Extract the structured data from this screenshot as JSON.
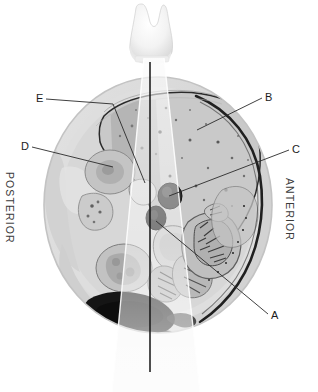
{
  "figure": {
    "kind": "anatomical-cross-section-with-ultrasound-beam",
    "modality_overlay": "ultrasound sector beam",
    "background_color": "#ffffff",
    "ink_color": "#1b1b1b",
    "section_plane": "transverse abdominal section",
    "probe": {
      "name": "transducer",
      "position": "top midline",
      "beam_apex_x": 143,
      "beam_center_line_bottom_y": 372
    }
  },
  "orientation_labels": [
    {
      "text": "POSTERIOR",
      "side": "left",
      "rotation_deg": 90
    },
    {
      "text": "ANTERIOR",
      "side": "right",
      "rotation_deg": 90
    }
  ],
  "leader_labels": [
    {
      "letter": "A",
      "label_x": 272,
      "label_y": 318,
      "target_x": 157,
      "target_y": 221,
      "target_structure": "inferior vena cava",
      "text_side": "right"
    },
    {
      "letter": "B",
      "label_x": 266,
      "label_y": 94,
      "target_x": 197,
      "target_y": 129,
      "target_structure": "liver parenchyma",
      "text_side": "right"
    },
    {
      "letter": "C",
      "label_x": 293,
      "label_y": 146,
      "target_x": 169,
      "target_y": 195,
      "target_structure": "abdominal aorta",
      "text_side": "right"
    },
    {
      "letter": "D",
      "label_x": 22,
      "label_y": 143,
      "target_x": 113,
      "target_y": 166,
      "target_structure": "right kidney",
      "text_side": "left"
    },
    {
      "letter": "E",
      "label_x": 38,
      "label_y": 95,
      "elbow_x": 113,
      "elbow_y": 104,
      "target_x": 144,
      "target_y": 182,
      "target_structure": "diaphragm / liver border",
      "text_side": "left"
    }
  ],
  "anatomy_regions": [
    {
      "name": "body-wall-outline",
      "tone": "#d9d9d9"
    },
    {
      "name": "subcutaneous-fat",
      "tone": "#e6e6e6"
    },
    {
      "name": "liver",
      "tone": "#c6c6c6"
    },
    {
      "name": "liver-beam-shadow",
      "tone": "#a9a9a9"
    },
    {
      "name": "right-kidney",
      "tone": "#c0c0c0"
    },
    {
      "name": "vertebral-body",
      "tone": "#cfcfcf"
    },
    {
      "name": "aorta",
      "tone": "#2e2e2e"
    },
    {
      "name": "inferior-vena-cava",
      "tone": "#262626"
    },
    {
      "name": "bowel-gas",
      "tone": "#141414"
    },
    {
      "name": "spleen",
      "tone": "#bdbdbd"
    },
    {
      "name": "stomach-bowel-loops",
      "tone": "#b5b5b5"
    },
    {
      "name": "anterior-skin-line",
      "tone": "#1f1f1f"
    },
    {
      "name": "ultrasound-sector-beam",
      "tone": "#f2f2f2"
    }
  ]
}
